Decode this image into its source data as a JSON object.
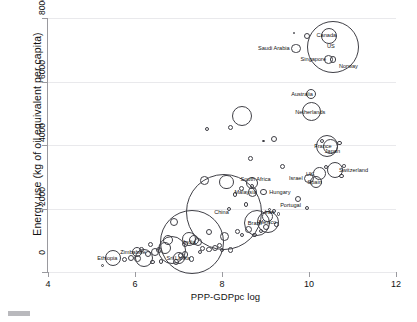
{
  "figure": {
    "corner_mark": "page-artifact"
  },
  "chart_data": {
    "type": "scatter",
    "title": "",
    "xlabel": "PPP-GDPpc log",
    "ylabel": "Energy use (kg of oil equivalent per capita)",
    "xlim": [
      4,
      12
    ],
    "ylim": [
      0,
      8000
    ],
    "xticks": [
      4,
      6,
      8,
      10,
      12
    ],
    "yticks": [
      0,
      2000,
      4000,
      6000,
      8000
    ],
    "grid": "horizontal",
    "legend": "none",
    "bubble_encoding": "population (circle area)",
    "marker_style": "open circles, black outline",
    "points": [
      {
        "label": "US",
        "x": 10.55,
        "y": 7100,
        "r": 26.0
      },
      {
        "label": "Canada",
        "x": 10.45,
        "y": 7420,
        "r": 8.0
      },
      {
        "label": "Saudi Arabia",
        "x": 9.7,
        "y": 7050,
        "r": 4.6
      },
      {
        "label": "Singapore",
        "x": 10.45,
        "y": 6700,
        "r": 4.4
      },
      {
        "label": "Norway",
        "x": 10.55,
        "y": 6700,
        "r": 3.4
      },
      {
        "label": "Australia",
        "x": 10.05,
        "y": 5620,
        "r": 5.0
      },
      {
        "label": "Netherlands",
        "x": 10.05,
        "y": 5050,
        "r": 9.6
      },
      {
        "label": "Switzerland",
        "x": 10.6,
        "y": 3210,
        "r": 8.2
      },
      {
        "label": "UK",
        "x": 10.25,
        "y": 3100,
        "r": 6.4
      },
      {
        "label": "Israel",
        "x": 10.0,
        "y": 2950,
        "r": 4.6
      },
      {
        "label": "Spain",
        "x": 10.15,
        "y": 2820,
        "r": 6.0
      },
      {
        "label": "Portugal",
        "x": 9.75,
        "y": 2290,
        "r": 3.2
      },
      {
        "label": "France",
        "x": 10.42,
        "y": 3980,
        "r": 11.0
      },
      {
        "label": "Japan",
        "x": 10.5,
        "y": 3950,
        "r": 7.6
      },
      {
        "label": "South Africa",
        "x": 8.7,
        "y": 2790,
        "r": 6.0
      },
      {
        "label": "Malaysia",
        "x": 8.7,
        "y": 2520,
        "r": 4.6
      },
      {
        "label": "Hungary",
        "x": 8.95,
        "y": 2520,
        "r": 3.4
      },
      {
        "label": "China",
        "x": 8.05,
        "y": 1880,
        "r": 38.0
      },
      {
        "label": "Brazil",
        "x": 8.8,
        "y": 1530,
        "r": 13.0
      },
      {
        "label": "Mexico",
        "x": 9.05,
        "y": 1560,
        "r": 11.0
      },
      {
        "label": "Iran",
        "x": 9.05,
        "y": 1750,
        "r": 5.4
      },
      {
        "label": "India",
        "x": 7.3,
        "y": 960,
        "r": 32.0
      },
      {
        "label": "Sri Lanka",
        "x": 7.0,
        "y": 450,
        "r": 6.0
      },
      {
        "label": "Ethiopia",
        "x": 5.5,
        "y": 430,
        "r": 8.0
      },
      {
        "label": "Zimbabwe",
        "x": 6.05,
        "y": 620,
        "r": 5.0
      }
    ],
    "unlabeled_points": [
      {
        "x": 9.65,
        "y": 7520,
        "r": 1.2
      },
      {
        "x": 9.95,
        "y": 7440,
        "r": 3.0
      },
      {
        "x": 8.45,
        "y": 4900,
        "r": 10.0
      },
      {
        "x": 8.2,
        "y": 4550,
        "r": 2.6
      },
      {
        "x": 7.65,
        "y": 4500,
        "r": 2.0
      },
      {
        "x": 9.2,
        "y": 4200,
        "r": 3.0
      },
      {
        "x": 8.95,
        "y": 4120,
        "r": 1.2
      },
      {
        "x": 10.3,
        "y": 4120,
        "r": 2.0
      },
      {
        "x": 10.7,
        "y": 4070,
        "r": 2.2
      },
      {
        "x": 8.65,
        "y": 3580,
        "r": 2.4
      },
      {
        "x": 9.4,
        "y": 3330,
        "r": 2.6
      },
      {
        "x": 10.8,
        "y": 3340,
        "r": 1.8
      },
      {
        "x": 10.75,
        "y": 3030,
        "r": 2.2
      },
      {
        "x": 10.38,
        "y": 3320,
        "r": 2.0
      },
      {
        "x": 7.6,
        "y": 2880,
        "r": 4.4
      },
      {
        "x": 8.1,
        "y": 2830,
        "r": 7.2
      },
      {
        "x": 8.45,
        "y": 2620,
        "r": 2.6
      },
      {
        "x": 8.3,
        "y": 2440,
        "r": 2.2
      },
      {
        "x": 8.7,
        "y": 2720,
        "r": 2.0
      },
      {
        "x": 9.95,
        "y": 2010,
        "r": 2.2
      },
      {
        "x": 8.55,
        "y": 2120,
        "r": 2.4
      },
      {
        "x": 9.2,
        "y": 1920,
        "r": 2.0
      },
      {
        "x": 9.1,
        "y": 1960,
        "r": 1.6
      },
      {
        "x": 8.15,
        "y": 1980,
        "r": 2.0
      },
      {
        "x": 7.7,
        "y": 1250,
        "r": 3.0
      },
      {
        "x": 8.05,
        "y": 1120,
        "r": 4.6
      },
      {
        "x": 8.35,
        "y": 1270,
        "r": 2.4
      },
      {
        "x": 8.6,
        "y": 1350,
        "r": 3.6
      },
      {
        "x": 8.45,
        "y": 1180,
        "r": 2.0
      },
      {
        "x": 6.9,
        "y": 1590,
        "r": 4.0
      },
      {
        "x": 7.25,
        "y": 1050,
        "r": 7.0
      },
      {
        "x": 7.35,
        "y": 1000,
        "r": 5.0
      },
      {
        "x": 7.45,
        "y": 930,
        "r": 4.0
      },
      {
        "x": 6.85,
        "y": 700,
        "r": 14.0
      },
      {
        "x": 6.7,
        "y": 760,
        "r": 6.0
      },
      {
        "x": 6.45,
        "y": 620,
        "r": 4.0
      },
      {
        "x": 6.3,
        "y": 560,
        "r": 3.2
      },
      {
        "x": 6.55,
        "y": 700,
        "r": 3.0
      },
      {
        "x": 6.2,
        "y": 430,
        "r": 9.0
      },
      {
        "x": 6.05,
        "y": 420,
        "r": 3.4
      },
      {
        "x": 5.9,
        "y": 450,
        "r": 3.0
      },
      {
        "x": 5.75,
        "y": 400,
        "r": 2.6
      },
      {
        "x": 5.25,
        "y": 210,
        "r": 1.6
      },
      {
        "x": 7.85,
        "y": 760,
        "r": 3.0
      },
      {
        "x": 7.7,
        "y": 700,
        "r": 2.6
      },
      {
        "x": 7.55,
        "y": 740,
        "r": 2.4
      },
      {
        "x": 8.0,
        "y": 700,
        "r": 2.2
      },
      {
        "x": 8.2,
        "y": 690,
        "r": 2.6
      },
      {
        "x": 7.95,
        "y": 830,
        "r": 2.4
      },
      {
        "x": 7.15,
        "y": 560,
        "r": 3.4
      },
      {
        "x": 7.05,
        "y": 520,
        "r": 2.8
      },
      {
        "x": 6.95,
        "y": 330,
        "r": 3.0
      },
      {
        "x": 7.3,
        "y": 410,
        "r": 2.6
      },
      {
        "x": 6.6,
        "y": 330,
        "r": 2.4
      },
      {
        "x": 6.4,
        "y": 310,
        "r": 2.2
      },
      {
        "x": 9.0,
        "y": 1420,
        "r": 3.0
      },
      {
        "x": 9.25,
        "y": 1500,
        "r": 2.2
      },
      {
        "x": 8.9,
        "y": 1300,
        "r": 2.0
      },
      {
        "x": 8.75,
        "y": 1170,
        "r": 2.2
      },
      {
        "x": 9.3,
        "y": 1820,
        "r": 1.8
      },
      {
        "x": 7.5,
        "y": 620,
        "r": 2.0
      },
      {
        "x": 6.75,
        "y": 1000,
        "r": 5.0
      },
      {
        "x": 7.15,
        "y": 880,
        "r": 3.4
      },
      {
        "x": 6.35,
        "y": 870,
        "r": 2.6
      },
      {
        "x": 6.15,
        "y": 700,
        "r": 2.4
      }
    ]
  }
}
